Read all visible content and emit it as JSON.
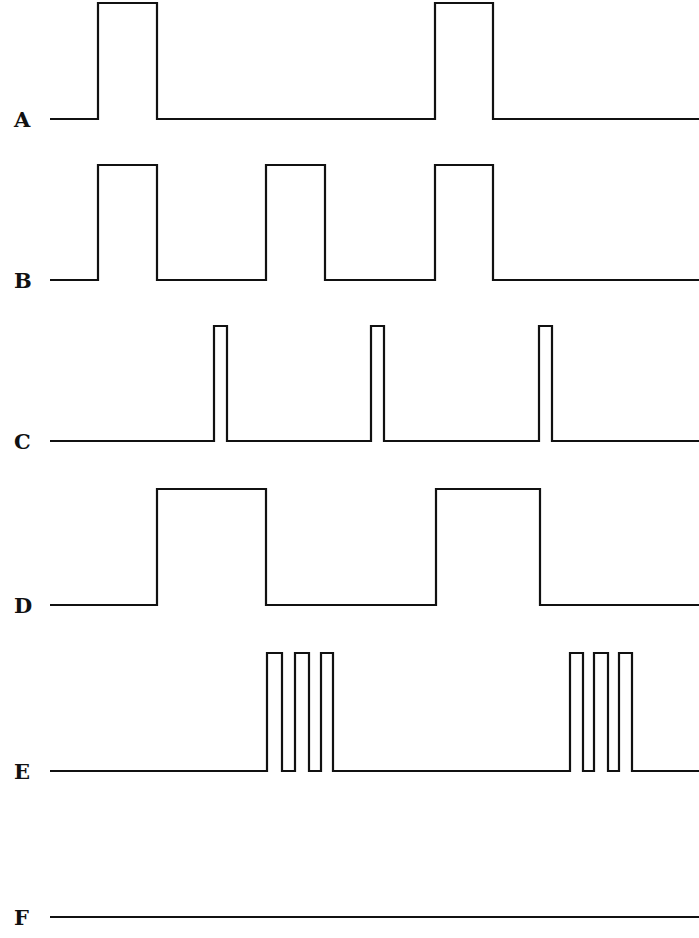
{
  "diagram": {
    "type": "timing-waveforms",
    "stroke_color": "#111111",
    "background": "#ffffff",
    "x_start": 50,
    "x_end": 699,
    "signals": [
      {
        "label": "A",
        "label_x": 14,
        "low_y": 119,
        "high_y": 3,
        "pulses": [
          [
            98,
            157
          ],
          [
            435,
            493
          ]
        ]
      },
      {
        "label": "B",
        "label_x": 14,
        "low_y": 280,
        "high_y": 165,
        "pulses": [
          [
            98,
            157
          ],
          [
            266,
            325
          ],
          [
            435,
            493
          ]
        ]
      },
      {
        "label": "C",
        "label_x": 14,
        "low_y": 441,
        "high_y": 326,
        "pulses": [
          [
            214,
            227
          ],
          [
            371,
            384
          ],
          [
            539,
            552
          ]
        ]
      },
      {
        "label": "D",
        "label_x": 14,
        "low_y": 605,
        "high_y": 489,
        "pulses": [
          [
            157,
            266
          ],
          [
            436,
            540
          ]
        ]
      },
      {
        "label": "E",
        "label_x": 14,
        "low_y": 771,
        "high_y": 653,
        "pulses": [
          [
            267,
            282
          ],
          [
            295,
            309
          ],
          [
            321,
            333
          ],
          [
            570,
            583
          ],
          [
            594,
            608
          ],
          [
            619,
            632
          ]
        ]
      },
      {
        "label": "F",
        "label_x": 14,
        "low_y": 917,
        "high_y": 917,
        "pulses": []
      }
    ]
  }
}
